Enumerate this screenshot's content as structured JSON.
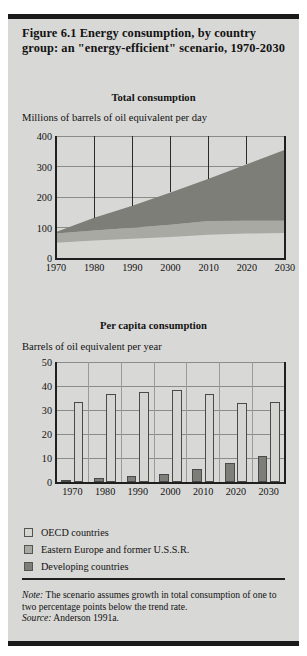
{
  "figure": {
    "title": "Figure 6.1  Energy consumption, by country group: an \"energy-efficient\" scenario, 1970-2030",
    "note_label": "Note:",
    "note_text": "The scenario assumes growth in total consumption of one to two percentage points below the trend rate.",
    "source_label": "Source:",
    "source_text": "Anderson 1991a."
  },
  "legend": {
    "items": [
      {
        "label": "OECD countries",
        "color": "#d5d5d2"
      },
      {
        "label": "Eastern Europe and former U.S.S.R.",
        "color": "#a9a9a4"
      },
      {
        "label": "Developing countries",
        "color": "#7e7e79"
      }
    ]
  },
  "chart_data": [
    {
      "type": "area",
      "id": "total-consumption",
      "title": "Total consumption",
      "ylabel": "Millions of barrels of oil equivalent per day",
      "xlabel": "",
      "x": [
        1970,
        1980,
        1990,
        2000,
        2010,
        2020,
        2030
      ],
      "xticks": [
        "1970",
        "1980",
        "1990",
        "2000",
        "2010",
        "2020",
        "2030"
      ],
      "yticks": [
        "400",
        "300",
        "200",
        "100",
        "0"
      ],
      "ylim": [
        0,
        400
      ],
      "xlim": [
        1970,
        2030
      ],
      "grid": true,
      "stacked": true,
      "series": [
        {
          "name": "OECD countries",
          "color": "#d5d5d2",
          "values": [
            50,
            57,
            63,
            69,
            76,
            80,
            82
          ]
        },
        {
          "name": "Eastern Europe and former U.S.S.R.",
          "color": "#a9a9a4",
          "values": [
            30,
            33,
            36,
            40,
            45,
            42,
            40
          ]
        },
        {
          "name": "Developing countries",
          "color": "#7e7e79",
          "values": [
            5,
            42,
            72,
            106,
            139,
            185,
            233
          ]
        }
      ],
      "totals": [
        85,
        132,
        171,
        215,
        260,
        307,
        355
      ]
    },
    {
      "type": "bar",
      "id": "per-capita-consumption",
      "title": "Per capita consumption",
      "ylabel": "Barrels of oil equivalent per year",
      "xlabel": "",
      "categories": [
        "1970",
        "1980",
        "1990",
        "2000",
        "2010",
        "2020",
        "2030"
      ],
      "yticks": [
        "50",
        "40",
        "30",
        "20",
        "10",
        "0"
      ],
      "ylim": [
        0,
        50
      ],
      "grid": true,
      "series": [
        {
          "name": "OECD countries",
          "color": "#d5d5d2",
          "values": [
            33.5,
            36.5,
            37.5,
            38.5,
            36.5,
            33.0,
            33.5
          ]
        },
        {
          "name": "Developing countries",
          "color": "#7e7e79",
          "values": [
            1.0,
            1.5,
            2.5,
            3.5,
            5.5,
            8.0,
            11.0
          ]
        }
      ]
    }
  ]
}
